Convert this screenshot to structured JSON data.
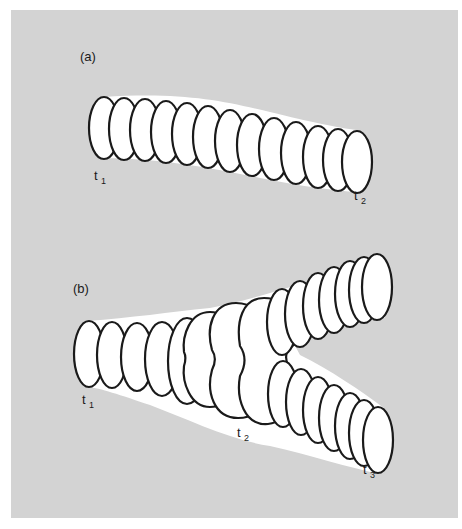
{
  "figure": {
    "background_color": "#d3d3d3",
    "cell_fill": "#ffffff",
    "outline_color": "#1a1a1a"
  },
  "panel_a": {
    "label": "(a)",
    "start_label": {
      "base": "t",
      "sub": "1"
    },
    "end_label": {
      "base": "t",
      "sub": "2"
    },
    "description": "Single cylinder of stacked elliptical cross-sections moving from t1 to t2",
    "cell_count": 13
  },
  "panel_b": {
    "label": "(b)",
    "start_label": {
      "base": "t",
      "sub": "1"
    },
    "branch_label": {
      "base": "t",
      "sub": "2"
    },
    "end_label": {
      "base": "t",
      "sub": "3"
    },
    "description": "Cylinder of cross-sections that grows, pinches at t2 and splits into two branches ending at t3",
    "trunk_cell_count": 7,
    "upper_branch_cell_count": 8,
    "lower_branch_cell_count": 8
  }
}
